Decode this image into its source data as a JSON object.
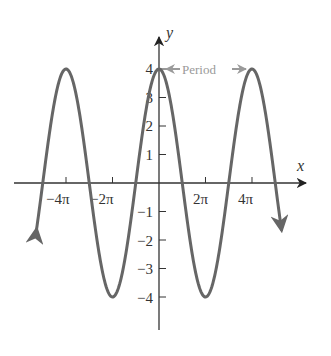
{
  "chart_data": {
    "type": "line",
    "title": "",
    "function": "y = 4 cos(x/2)",
    "xlabel": "x",
    "ylabel": "y",
    "xlim": [
      -17.5,
      18.0
    ],
    "ylim": [
      -5.0,
      5.0
    ],
    "x_tick_labels": [
      "−4π",
      "−2π",
      "2π",
      "4π"
    ],
    "x_tick_values": [
      -12.566,
      -6.283,
      6.283,
      12.566
    ],
    "y_tick_labels": [
      "4",
      "3",
      "2",
      "1",
      "−1",
      "−2",
      "−3",
      "−4"
    ],
    "y_tick_values": [
      4,
      3,
      2,
      1,
      -1,
      -2,
      -3,
      -4
    ],
    "series": [
      {
        "name": "4cos(x/2)",
        "color": "#666666",
        "amplitude": 4,
        "period": "4π",
        "peaks_x": [
          "−4π",
          "0",
          "4π"
        ],
        "troughs_x": [
          "−2π",
          "2π"
        ],
        "x": [
          -16.5,
          -12.566,
          -9.425,
          -6.283,
          -3.142,
          0,
          3.142,
          6.283,
          9.425,
          12.566,
          16.5
        ],
        "values": [
          -2.8,
          4,
          0,
          -4,
          0,
          4,
          0,
          -4,
          0,
          4,
          -2.8
        ],
        "arrows_both_ends": true
      }
    ],
    "annotations": [
      {
        "text": "Period",
        "from_x": "0",
        "to_x": "4π",
        "y": 4,
        "color": "#9a9a9a"
      }
    ],
    "grid": false,
    "legend": null
  },
  "labels": {
    "x_axis": "x",
    "y_axis": "y",
    "period": "Period"
  },
  "colors": {
    "curve": "#666666",
    "axes": "#333333",
    "annotation": "#9a9a9a"
  }
}
